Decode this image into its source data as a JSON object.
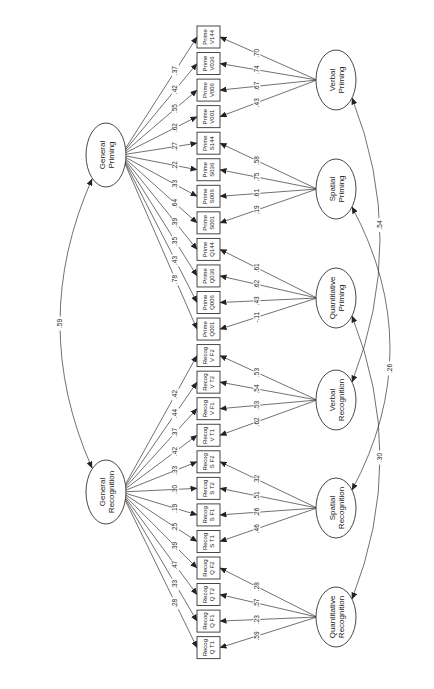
{
  "diagram": {
    "type": "structural-equation-path-diagram",
    "orientation": "rotated-90",
    "observed": [
      {
        "id": "PV144",
        "line1": "Prime",
        "line2": "V144"
      },
      {
        "id": "PV036",
        "line1": "Prime",
        "line2": "V036"
      },
      {
        "id": "PV006",
        "line1": "Prime",
        "line2": "V006"
      },
      {
        "id": "PV001",
        "line1": "Prime",
        "line2": "V001"
      },
      {
        "id": "PS144",
        "line1": "Prime",
        "line2": "S144"
      },
      {
        "id": "PS036",
        "line1": "Prime",
        "line2": "S036"
      },
      {
        "id": "PS006",
        "line1": "Prime",
        "line2": "S006"
      },
      {
        "id": "PS001",
        "line1": "Prime",
        "line2": "S001"
      },
      {
        "id": "PQ144",
        "line1": "Prime",
        "line2": "Q144"
      },
      {
        "id": "PQ036",
        "line1": "Prime",
        "line2": "Q036"
      },
      {
        "id": "PQ006",
        "line1": "Prime",
        "line2": "Q006"
      },
      {
        "id": "PQ001",
        "line1": "Prime",
        "line2": "Q001"
      },
      {
        "id": "RVF2",
        "line1": "Recog",
        "line2": "V F2"
      },
      {
        "id": "RVT2",
        "line1": "Recog",
        "line2": "V T2"
      },
      {
        "id": "RVF1",
        "line1": "Recog",
        "line2": "V F1"
      },
      {
        "id": "RVT1",
        "line1": "Recog",
        "line2": "V T1"
      },
      {
        "id": "RSF2",
        "line1": "Recog",
        "line2": "S F2"
      },
      {
        "id": "RST2",
        "line1": "Recog",
        "line2": "S T2"
      },
      {
        "id": "RSF1",
        "line1": "Recog",
        "line2": "S F1"
      },
      {
        "id": "RST1",
        "line1": "Recog",
        "line2": "S T1"
      },
      {
        "id": "RQF2",
        "line1": "Recog",
        "line2": "Q F2"
      },
      {
        "id": "RQT2",
        "line1": "Recog",
        "line2": "Q T2"
      },
      {
        "id": "RQF1",
        "line1": "Recog",
        "line2": "Q F1"
      },
      {
        "id": "RQT1",
        "line1": "Recog",
        "line2": "Q T1"
      }
    ],
    "general_factors": [
      {
        "id": "GP",
        "line1": "General",
        "line2": "Priming",
        "loadings": [
          ".37",
          ".42",
          ".55",
          ".62",
          ".27",
          ".22",
          ".33",
          ".64",
          ".39",
          ".35",
          ".43",
          ".78"
        ]
      },
      {
        "id": "GR",
        "line1": "General",
        "line2": "Recognition",
        "loadings": [
          ".42",
          ".44",
          ".37",
          ".42",
          ".33",
          ".30",
          ".19",
          ".25",
          ".39",
          ".47",
          ".33",
          ".28"
        ]
      }
    ],
    "specific_factors": [
      {
        "id": "VP",
        "line1": "Verbal",
        "line2": "Priming",
        "loadings": [
          ".70",
          ".74",
          ".67",
          ".43"
        ]
      },
      {
        "id": "SP",
        "line1": "Spatial",
        "line2": "Priming",
        "loadings": [
          ".58",
          ".75",
          ".61",
          ".19"
        ]
      },
      {
        "id": "QP",
        "line1": "Quantitative",
        "line2": "Priming",
        "loadings": [
          ".61",
          ".62",
          ".43",
          "-.11"
        ]
      },
      {
        "id": "VR",
        "line1": "Verbal",
        "line2": "Recognition",
        "loadings": [
          ".53",
          ".54",
          ".53",
          ".62"
        ]
      },
      {
        "id": "SR",
        "line1": "Spatial",
        "line2": "Recognition",
        "loadings": [
          ".32",
          ".51",
          ".26",
          ".46"
        ]
      },
      {
        "id": "QR",
        "line1": "Quantitative",
        "line2": "Recognition",
        "loadings": [
          ".28",
          ".57",
          ".23",
          ".59"
        ]
      }
    ],
    "covariances": [
      {
        "from": "General Priming",
        "to": "General Recognition",
        "value": ".59"
      },
      {
        "from": "Verbal Priming",
        "to": "Verbal Recognition",
        "value": ".54"
      },
      {
        "from": "Spatial Priming",
        "to": "Spatial Recognition",
        "value": ".26"
      },
      {
        "from": "Quantitative Priming",
        "to": "Quantitative Recognition",
        "value": ".30"
      }
    ]
  }
}
